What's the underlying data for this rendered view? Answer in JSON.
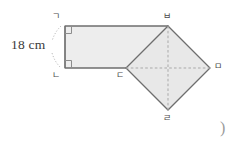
{
  "figure": {
    "type": "geometry-diagram",
    "measurement_label": "18 cm",
    "corner_mark": ")",
    "colors": {
      "rectangle_fill": "#ededed",
      "diamond_fill": "#e8e8e8",
      "outline": "#6e6e6e",
      "dashed_line": "#a9a9a9",
      "label_text": "#4b4b4b",
      "measure_text": "#3a3a3a",
      "dotted_brace": "#bdbdbd",
      "background": "#ffffff"
    },
    "vertices": [
      {
        "name": "vertex-g",
        "label": "ㄱ",
        "x": 65,
        "y": 26,
        "label_x": 52,
        "label_y": 12
      },
      {
        "name": "vertex-n",
        "label": "ㄴ",
        "x": 65,
        "y": 68,
        "label_x": 52,
        "label_y": 71
      },
      {
        "name": "vertex-d",
        "label": "ㄷ",
        "x": 126,
        "y": 68,
        "label_x": 116,
        "label_y": 71
      },
      {
        "name": "vertex-r",
        "label": "ㄹ",
        "x": 168,
        "y": 110,
        "label_x": 163,
        "label_y": 114
      },
      {
        "name": "vertex-m",
        "label": "ㅁ",
        "x": 210,
        "y": 68,
        "label_x": 214,
        "label_y": 62
      },
      {
        "name": "vertex-b",
        "label": "ㅂ",
        "x": 168,
        "y": 26,
        "label_x": 163,
        "label_y": 12
      }
    ],
    "shapes": {
      "rectangle": {
        "name": "rectangle-gbdn",
        "points": "65,26 168,26 168,68 65,68",
        "right_angles": [
          "top-left",
          "bottom-left"
        ]
      },
      "diamond": {
        "name": "diamond-bmrd",
        "points": "168,26 210,68 168,110 126,68",
        "diagonals": [
          {
            "name": "diagonal-horizontal",
            "x1": 126,
            "y1": 68,
            "x2": 210,
            "y2": 68
          },
          {
            "name": "diagonal-vertical",
            "x1": 168,
            "y1": 26,
            "x2": 168,
            "y2": 110
          }
        ]
      }
    },
    "measure_text_position": {
      "x": 11,
      "y": 38
    }
  }
}
